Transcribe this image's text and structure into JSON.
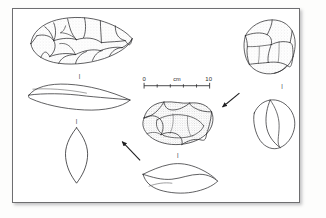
{
  "figure": {
    "background_color": "#fdfdfc",
    "plate_background": "#ffffff",
    "border_color": "#6e6e70",
    "ink_color": "#2a2a2c",
    "stipple_color": "#9a9a9c"
  },
  "scale_bar": {
    "name": "scale-bar",
    "start_label": "0",
    "unit_label": "cm",
    "end_label": "10",
    "tick_count": 5,
    "length_px": 66
  },
  "artifacts": [
    {
      "id": "handaxe-dorsal",
      "label": "",
      "caption": "",
      "view": "dorsal",
      "divider": "|"
    },
    {
      "id": "handaxe-profile",
      "label": "",
      "caption": "",
      "view": "profile",
      "divider": "|"
    },
    {
      "id": "handaxe-section",
      "label": "",
      "caption": "",
      "view": "cross-section",
      "divider": ""
    },
    {
      "id": "discoid-core-dorsal",
      "label": "",
      "caption": "",
      "view": "dorsal",
      "divider": "|"
    },
    {
      "id": "discoid-core-profile",
      "label": "",
      "caption": "",
      "view": "profile",
      "divider": ""
    },
    {
      "id": "polyhedral-core-dorsal",
      "label": "",
      "caption": "",
      "view": "dorsal",
      "divider": "|"
    },
    {
      "id": "polyhedral-core-profile",
      "label": "",
      "caption": "",
      "view": "profile",
      "divider": ""
    }
  ],
  "dividers": {
    "mark": "|"
  },
  "arrows": [
    {
      "id": "arrow-core-to-discoid",
      "direction": "down-left"
    },
    {
      "id": "arrow-discoid-to-handaxe",
      "direction": "up-left"
    }
  ]
}
